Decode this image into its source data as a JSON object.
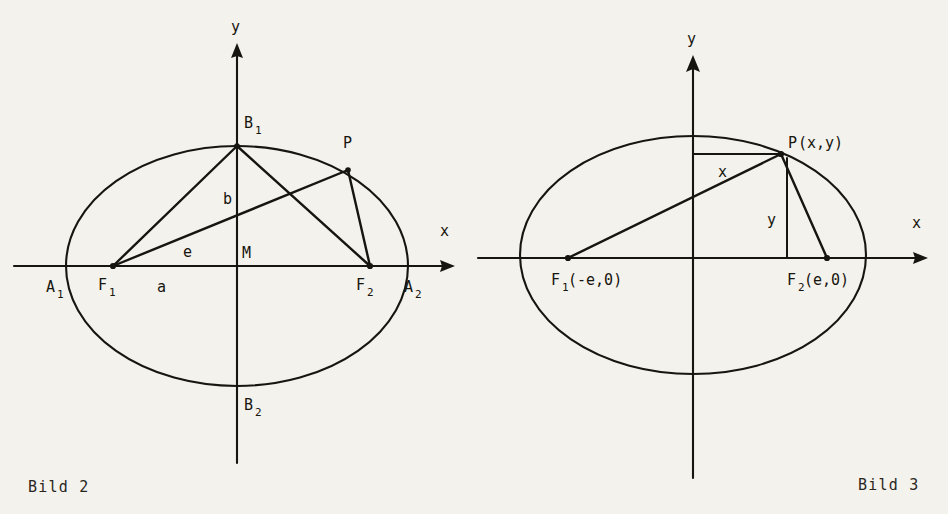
{
  "page": {
    "background_color": "#f4f2ec",
    "ink_color": "#17150f",
    "width": 948,
    "height": 514
  },
  "figures": [
    {
      "id": "bild-2",
      "caption": "Bild 2",
      "caption_pos": {
        "x": 28,
        "y": 492
      },
      "description": "Ellipse with centre M, semi-axes a and b, foci F1 and F2, vertices A1, A2, B1, B2 and a point P on the curve joined to both foci.",
      "geometry": {
        "center": {
          "x": 237,
          "y": 266
        },
        "semi_axis_a": 171,
        "semi_axis_b": 120,
        "focus_offset_e": 125,
        "point_P": {
          "x": 348,
          "y": 170
        },
        "x_axis": {
          "x1": 14,
          "x2": 455,
          "y": 266
        },
        "y_axis": {
          "x": 237,
          "y1": 43,
          "y2": 463
        }
      },
      "axis_labels": [
        {
          "name": "x-axis-label",
          "text": "x",
          "x": 440,
          "y": 236
        },
        {
          "name": "y-axis-label",
          "text": "y",
          "x": 231,
          "y": 32
        }
      ],
      "point_labels": [
        {
          "name": "vertex-a1-label",
          "base": "A",
          "sub": "1",
          "x": 46,
          "y": 292
        },
        {
          "name": "vertex-a2-label",
          "base": "A",
          "sub": "2",
          "x": 404,
          "y": 292
        },
        {
          "name": "focus-f1-label",
          "base": "F",
          "sub": "1",
          "x": 98,
          "y": 290
        },
        {
          "name": "focus-f2-label",
          "base": "F",
          "sub": "2",
          "x": 356,
          "y": 290
        },
        {
          "name": "vertex-b1-label",
          "base": "B",
          "sub": "1",
          "x": 244,
          "y": 128
        },
        {
          "name": "vertex-b2-label",
          "base": "B",
          "sub": "2",
          "x": 244,
          "y": 410
        },
        {
          "name": "point-p-label",
          "base": "P",
          "sub": "",
          "x": 343,
          "y": 148
        },
        {
          "name": "centre-m-label",
          "base": "M",
          "sub": "",
          "x": 242,
          "y": 258
        },
        {
          "name": "semi-axis-b-label",
          "base": "b",
          "sub": "",
          "x": 223,
          "y": 204
        },
        {
          "name": "linear-eccentricity-e-label",
          "base": "e",
          "sub": "",
          "x": 183,
          "y": 257
        },
        {
          "name": "semi-axis-a-label",
          "base": "a",
          "sub": "",
          "x": 157,
          "y": 292
        }
      ]
    },
    {
      "id": "bild-3",
      "caption": "Bild 3",
      "caption_pos": {
        "x": 858,
        "y": 490
      },
      "description": "Ellipse with foci F1(-e,0) and F2(e,0) and point P(x,y) on the curve, showing the coordinate offsets x and y of P.",
      "geometry": {
        "center": {
          "x": 693,
          "y": 255
        },
        "semi_axis_a": 173,
        "semi_axis_b": 119,
        "focus_offset_e": 125,
        "point_P": {
          "x": 781,
          "y": 154
        },
        "x_axis": {
          "x1": 478,
          "x2": 928,
          "y": 258
        },
        "y_axis": {
          "x": 693,
          "y1": 55,
          "y2": 478
        },
        "drop_line_x": 787
      },
      "axis_labels": [
        {
          "name": "x-axis-label",
          "text": "x",
          "x": 912,
          "y": 228
        },
        {
          "name": "y-axis-label",
          "text": "y",
          "x": 687,
          "y": 44
        }
      ],
      "point_labels": [
        {
          "name": "point-p-label",
          "base": "P",
          "sub": "",
          "suffix": "(x,y)",
          "x": 788,
          "y": 148
        },
        {
          "name": "focus-f1-label",
          "base": "F",
          "sub": "1",
          "suffix": "(-e,0)",
          "x": 551,
          "y": 285
        },
        {
          "name": "focus-f2-label",
          "base": "F",
          "sub": "2",
          "suffix": "(e,0)",
          "x": 787,
          "y": 285
        },
        {
          "name": "abscissa-x-label",
          "base": "x",
          "sub": "",
          "suffix": "",
          "x": 718,
          "y": 177
        },
        {
          "name": "ordinate-y-label",
          "base": "y",
          "sub": "",
          "suffix": "",
          "x": 767,
          "y": 225
        }
      ]
    }
  ]
}
